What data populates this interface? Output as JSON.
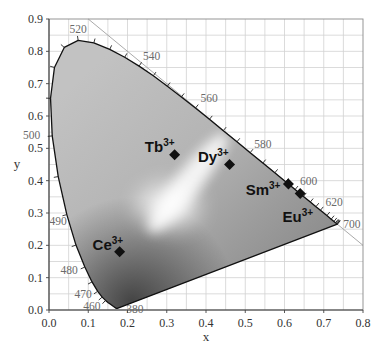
{
  "chart_data": {
    "type": "scatter",
    "title": "",
    "subtitle": "",
    "xlabel": "x",
    "ylabel": "y",
    "xlim": [
      0.0,
      0.8
    ],
    "ylim": [
      0.0,
      0.9
    ],
    "grid": true,
    "grid_step": 0.05,
    "legend": null,
    "xtick_labels": [
      "0.0",
      "0.1",
      "0.2",
      "0.3",
      "0.4",
      "0.5",
      "0.6",
      "0.7",
      "0.8"
    ],
    "ytick_labels": [
      "0.0",
      "0.1",
      "0.2",
      "0.3",
      "0.4",
      "0.5",
      "0.6",
      "0.7",
      "0.8",
      "0.9"
    ],
    "points": [
      {
        "ion": "Ce",
        "charge": "3+",
        "x": 0.18,
        "y": 0.18,
        "label_dx": 3.5,
        "label_dy": -2
      },
      {
        "ion": "Tb",
        "charge": "3+",
        "x": 0.32,
        "y": 0.48,
        "label_dx": 0,
        "label_dy": -3
      },
      {
        "ion": "Dy",
        "charge": "3+",
        "x": 0.46,
        "y": 0.45,
        "label_dx": -1,
        "label_dy": -2.5
      },
      {
        "ion": "Sm",
        "charge": "3+",
        "x": 0.61,
        "y": 0.39,
        "label_dx": -8,
        "label_dy": 11
      },
      {
        "ion": "Eu",
        "charge": "3+",
        "x": 0.64,
        "y": 0.36,
        "label_dx": 13,
        "label_dy": 28
      }
    ],
    "reference_line": {
      "from": [
        0.1,
        0.9
      ],
      "to": [
        0.8,
        0.2
      ],
      "equation": "x + y = 1"
    },
    "spectral_locus": [
      [
        380,
        0.1741,
        0.005
      ],
      [
        400,
        0.1733,
        0.0048
      ],
      [
        420,
        0.1714,
        0.0051
      ],
      [
        440,
        0.1644,
        0.0109
      ],
      [
        450,
        0.1566,
        0.0177
      ],
      [
        455,
        0.151,
        0.0227
      ],
      [
        460,
        0.144,
        0.0297
      ],
      [
        465,
        0.1355,
        0.0399
      ],
      [
        470,
        0.1241,
        0.0578
      ],
      [
        475,
        0.1096,
        0.0868
      ],
      [
        480,
        0.0913,
        0.1327
      ],
      [
        485,
        0.0687,
        0.2007
      ],
      [
        490,
        0.0454,
        0.295
      ],
      [
        495,
        0.0235,
        0.4127
      ],
      [
        500,
        0.0082,
        0.5384
      ],
      [
        505,
        0.0039,
        0.6548
      ],
      [
        510,
        0.0139,
        0.7502
      ],
      [
        515,
        0.0389,
        0.812
      ],
      [
        520,
        0.0743,
        0.8338
      ],
      [
        525,
        0.1142,
        0.8262
      ],
      [
        530,
        0.1547,
        0.8059
      ],
      [
        535,
        0.1929,
        0.7816
      ],
      [
        540,
        0.2296,
        0.7543
      ],
      [
        545,
        0.2658,
        0.7243
      ],
      [
        550,
        0.3016,
        0.6923
      ],
      [
        555,
        0.3373,
        0.6589
      ],
      [
        560,
        0.3731,
        0.6245
      ],
      [
        565,
        0.4087,
        0.5896
      ],
      [
        570,
        0.4441,
        0.5547
      ],
      [
        575,
        0.4788,
        0.5202
      ],
      [
        580,
        0.5125,
        0.4866
      ],
      [
        585,
        0.5448,
        0.4544
      ],
      [
        590,
        0.5752,
        0.4242
      ],
      [
        595,
        0.6029,
        0.3965
      ],
      [
        600,
        0.627,
        0.3725
      ],
      [
        605,
        0.6482,
        0.3514
      ],
      [
        610,
        0.6658,
        0.334
      ],
      [
        615,
        0.6801,
        0.3197
      ],
      [
        620,
        0.6915,
        0.3083
      ],
      [
        630,
        0.7079,
        0.292
      ],
      [
        640,
        0.719,
        0.2809
      ],
      [
        650,
        0.726,
        0.274
      ],
      [
        660,
        0.73,
        0.27
      ],
      [
        670,
        0.732,
        0.268
      ],
      [
        680,
        0.7334,
        0.2666
      ],
      [
        690,
        0.7344,
        0.2656
      ],
      [
        700,
        0.7347,
        0.2653
      ]
    ],
    "tick_from_nm": 460,
    "wavelength_labels": [
      {
        "nm": 380,
        "text": "380",
        "dx": 9,
        "dy": 5,
        "anchor": "start"
      },
      {
        "nm": 460,
        "text": "460",
        "dx": -5,
        "dy": 10,
        "anchor": "end"
      },
      {
        "nm": 470,
        "text": "470",
        "dx": -6,
        "dy": 7,
        "anchor": "end"
      },
      {
        "nm": 480,
        "text": "480",
        "dx": -7,
        "dy": 7,
        "anchor": "end"
      },
      {
        "nm": 490,
        "text": "490",
        "dx": 0,
        "dy": 10,
        "anchor": "end"
      },
      {
        "nm": 500,
        "text": "500",
        "dx": -12,
        "dy": 3,
        "anchor": "end"
      },
      {
        "nm": 520,
        "text": "520",
        "dx": 0,
        "dy": -7,
        "anchor": "middle"
      },
      {
        "nm": 540,
        "text": "540",
        "dx": 4,
        "dy": -6,
        "anchor": "start"
      },
      {
        "nm": 560,
        "text": "560",
        "dx": 5,
        "dy": -6,
        "anchor": "start"
      },
      {
        "nm": 580,
        "text": "580",
        "dx": 4,
        "dy": -5,
        "anchor": "start"
      },
      {
        "nm": 600,
        "text": "600",
        "dx": 5,
        "dy": -5,
        "anchor": "start"
      },
      {
        "nm": 620,
        "text": "620",
        "dx": 5,
        "dy": -4,
        "anchor": "start"
      },
      {
        "nm": 700,
        "text": "700",
        "dx": 6,
        "dy": 4,
        "anchor": "start"
      }
    ]
  },
  "colors": {
    "background": "#ffffff",
    "grid": "#d2d2d2",
    "frame": "#8a8a8a",
    "axis": "#444444",
    "reference_line": "#a0a0a0",
    "locus_stroke": "#111111",
    "locus_tick": "#222222",
    "marker": "#111111",
    "fill_light": "#c2c2c2",
    "fill_mid": "#a6a6a6",
    "fill_dark": "#8a8a8a",
    "shadow": "#000000",
    "glow": "#ffffff"
  }
}
